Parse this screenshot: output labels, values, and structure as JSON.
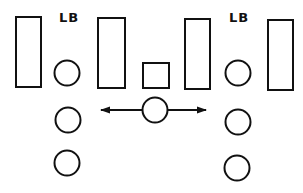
{
  "diagram": {
    "type": "football-formation",
    "stroke_color": "#111111",
    "background": "#ffffff",
    "labels": [
      {
        "text": "LB",
        "x": 59,
        "y": 22
      },
      {
        "text": "LB",
        "x": 229,
        "y": 22
      }
    ],
    "linemen": [
      {
        "x": 16,
        "y": 17,
        "w": 25,
        "h": 70
      },
      {
        "x": 98,
        "y": 18,
        "w": 27,
        "h": 70
      },
      {
        "x": 185,
        "y": 19,
        "w": 25,
        "h": 70
      },
      {
        "x": 268,
        "y": 20,
        "w": 25,
        "h": 70
      }
    ],
    "center_square": {
      "x": 143,
      "y": 63,
      "w": 26,
      "h": 25
    },
    "players": [
      {
        "cx": 67,
        "cy": 73,
        "r": 12.5
      },
      {
        "cx": 68,
        "cy": 120,
        "r": 12.5
      },
      {
        "cx": 67,
        "cy": 163,
        "r": 12.5
      },
      {
        "cx": 238,
        "cy": 73,
        "r": 12.5
      },
      {
        "cx": 238,
        "cy": 122,
        "r": 12.5
      },
      {
        "cx": 237,
        "cy": 168,
        "r": 12.5
      }
    ],
    "mover": {
      "cx": 155,
      "cy": 110,
      "r": 12.5
    },
    "arrow": {
      "y": 110,
      "x_left": 101,
      "x_right": 206
    }
  }
}
